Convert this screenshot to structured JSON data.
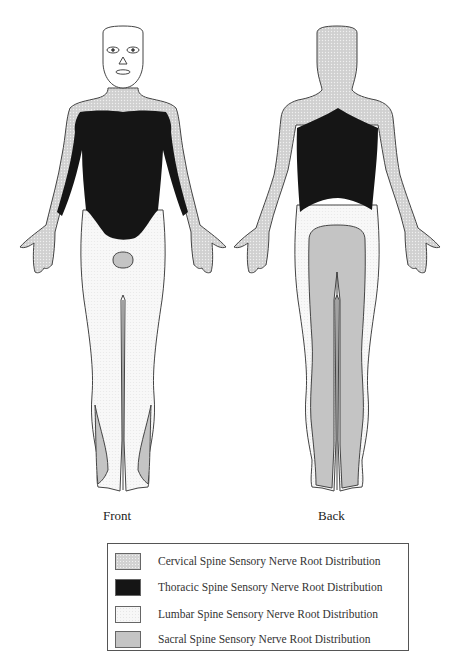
{
  "views": {
    "front_label": "Front",
    "back_label": "Back"
  },
  "legend": {
    "items": [
      {
        "key": "cervical",
        "label": "Cervical Spine Sensory Nerve Root Distribution",
        "color": "#d2d2d2",
        "pattern": "dotted"
      },
      {
        "key": "thoracic",
        "label": "Thoracic Spine Sensory Nerve Root Distribution",
        "color": "#151515",
        "pattern": "solid"
      },
      {
        "key": "lumbar",
        "label": "Lumbar Spine Sensory Nerve Root Distribution",
        "color": "#f7f7f7",
        "pattern": "dotted"
      },
      {
        "key": "sacral",
        "label": "Sacral Spine Sensory Nerve Root Distribution",
        "color": "#c4c4c4",
        "pattern": "solid"
      }
    ]
  }
}
